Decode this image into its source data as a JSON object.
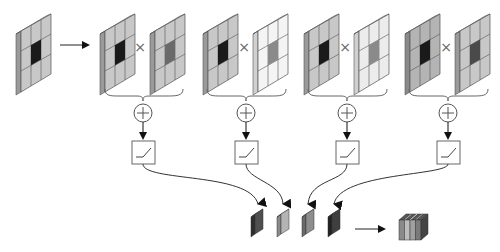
{
  "diagram": {
    "type": "block-diagram",
    "colors": {
      "grid_face": "#c8c8c8",
      "grid_side": "#9a9a9a",
      "grid_top": "#dcdcdc",
      "center_dark": "#1a1a1a",
      "kernel_center_mid": "#6a6a6a",
      "kernel_face_light": "#f0f0f0",
      "stroke": "#555555",
      "arrow": "#111111"
    },
    "input": {
      "label": "input-grid"
    },
    "operators": {
      "multiply": "×",
      "sum": "+"
    },
    "branches": [
      {
        "id": 1,
        "kernel_style": "gray",
        "output_color": "#4f4f4f"
      },
      {
        "id": 2,
        "kernel_style": "white",
        "output_color": "#a8a8a8"
      },
      {
        "id": 3,
        "kernel_style": "white",
        "output_color": "#8a8a8a"
      },
      {
        "id": 4,
        "kernel_style": "gray-dark-center",
        "output_color": "#3f3f3f"
      }
    ],
    "output": {
      "label": "concatenated-block",
      "stripes": [
        "#8a8a8a",
        "#bdbdbd",
        "#a0a0a0",
        "#7a7a7a"
      ]
    }
  }
}
